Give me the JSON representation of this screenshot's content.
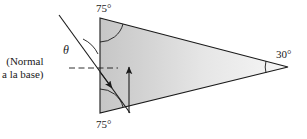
{
  "figure": {
    "name": "prism-refraction-diagram",
    "background_color": "#ffffff",
    "stroke_color": "#1a1a1a",
    "fill_light": "#f2f2f2",
    "fill_dark": "#c6c6c6"
  },
  "labels": {
    "angle_top": "75°",
    "angle_bottom": "75°",
    "angle_right": "30°",
    "theta": "θ",
    "normal_line1": "(Normal",
    "normal_line2": "a la base)"
  },
  "geometry": {
    "triangle_vertices": [
      [
        100,
        18
      ],
      [
        288,
        67
      ],
      [
        100,
        113
      ]
    ],
    "incident_ray_start": [
      59,
      15
    ],
    "incident_ray_end": [
      130,
      113
    ],
    "normal_dashed_start": [
      69,
      68
    ],
    "normal_dashed_end": [
      118,
      68
    ],
    "vertical_arrow_start": [
      129,
      113
    ],
    "vertical_arrow_end": [
      129,
      64
    ]
  }
}
